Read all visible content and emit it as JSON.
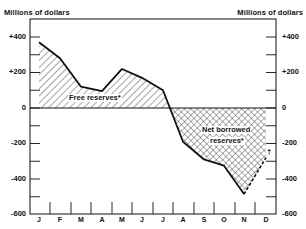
{
  "chart_data": {
    "type": "area",
    "title": "",
    "ylabel_left": "Millions of dollars",
    "ylabel_right": "Millions of dollars",
    "xlabel": "",
    "categories": [
      "J",
      "F",
      "M",
      "A",
      "M",
      "J",
      "J",
      "A",
      "S",
      "O",
      "N",
      "D"
    ],
    "series": [
      {
        "name": "Free reserves / Net borrowed reserves",
        "values": [
          370,
          280,
          120,
          95,
          220,
          170,
          100,
          -190,
          -290,
          -325,
          -485,
          -280
        ],
        "note": "December value drawn dashed (preliminary, marked †)"
      }
    ],
    "ylim": [
      -600,
      500
    ],
    "yticks": [
      400,
      200,
      0,
      -200,
      -400,
      -600
    ],
    "ytick_labels": [
      "+400",
      "+200",
      "0",
      "-200",
      "-400",
      "-600"
    ],
    "annotations": [
      {
        "text": "Free reserves*",
        "region": "positive area, diagonal hatching"
      },
      {
        "text": "Net borrowed reserves*",
        "region": "negative area, crosshatching"
      },
      {
        "text": "†",
        "region": "December dashed segment"
      }
    ],
    "grid": false,
    "legend": "none"
  },
  "axes": {
    "left_title": "Millions of dollars",
    "right_title": "Millions of dollars",
    "y_labels": [
      {
        "text": "+400",
        "y": 37
      },
      {
        "text": "+200",
        "y": 72
      },
      {
        "text": "0",
        "y": 108
      },
      {
        "text": "-200",
        "y": 143
      },
      {
        "text": "-400",
        "y": 179
      },
      {
        "text": "-600",
        "y": 214
      }
    ],
    "months": [
      "J",
      "F",
      "M",
      "A",
      "M",
      "J",
      "J",
      "A",
      "S",
      "O",
      "N",
      "D"
    ]
  },
  "labels": {
    "free": "Free reserves*",
    "net1": "Net borrowed",
    "net2": "reserves*",
    "dagger": "†"
  }
}
